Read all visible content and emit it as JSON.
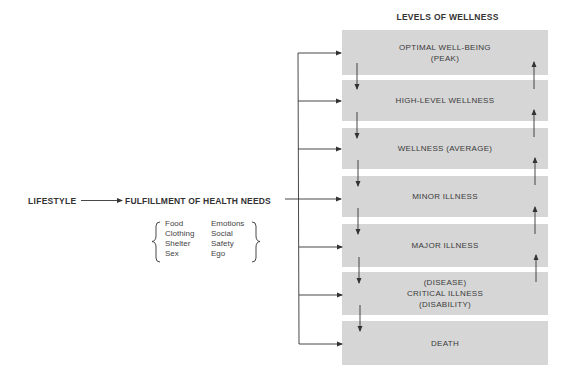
{
  "diagram": {
    "title": "LEVELS OF WELLNESS",
    "source_node": "LIFESTYLE",
    "middle_node": "FULFILLMENT OF HEALTH NEEDS",
    "needs": {
      "left_column": [
        "Food",
        "Clothing",
        "Shelter",
        "Sex"
      ],
      "right_column": [
        "Emotions",
        "Social",
        "Safety",
        "Ego"
      ]
    },
    "levels": [
      {
        "label": "OPTIMAL WELL-BEING\n(PEAK)"
      },
      {
        "label": "HIGH-LEVEL WELLNESS"
      },
      {
        "label": "WELLNESS (AVERAGE)"
      },
      {
        "label": "MINOR ILLNESS"
      },
      {
        "label": "MAJOR ILLNESS"
      },
      {
        "label": "(DISEASE)\nCRITICAL ILLNESS\n(DISABILITY)"
      },
      {
        "label": "DEATH"
      }
    ],
    "colors": {
      "box_fill": "#d6d6d6",
      "line": "#333333",
      "text": "#333333"
    }
  }
}
